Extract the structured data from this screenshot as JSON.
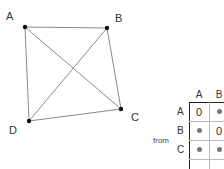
{
  "graph": {
    "nodes": [
      {
        "id": "A",
        "label": "A",
        "x": 25,
        "y": 27,
        "label_x": 6,
        "label_y": 11
      },
      {
        "id": "B",
        "label": "B",
        "x": 107,
        "y": 28,
        "label_x": 115,
        "label_y": 13
      },
      {
        "id": "C",
        "label": "C",
        "x": 121,
        "y": 109,
        "label_x": 131,
        "label_y": 112
      },
      {
        "id": "D",
        "label": "D",
        "x": 29,
        "y": 121,
        "label_x": 9,
        "label_y": 125
      }
    ],
    "edges": [
      [
        "A",
        "B"
      ],
      [
        "B",
        "C"
      ],
      [
        "C",
        "D"
      ],
      [
        "D",
        "A"
      ],
      [
        "A",
        "C"
      ],
      [
        "B",
        "D"
      ]
    ],
    "edge_color": "#8a8a8a",
    "node_color": "#111111"
  },
  "matrix": {
    "row_axis_label": "from",
    "col_headers": [
      "A",
      "B"
    ],
    "row_headers": [
      "A",
      "B",
      "C"
    ],
    "cells": [
      [
        "0",
        "•"
      ],
      [
        "•",
        "0"
      ],
      [
        "•",
        "•"
      ]
    ]
  }
}
